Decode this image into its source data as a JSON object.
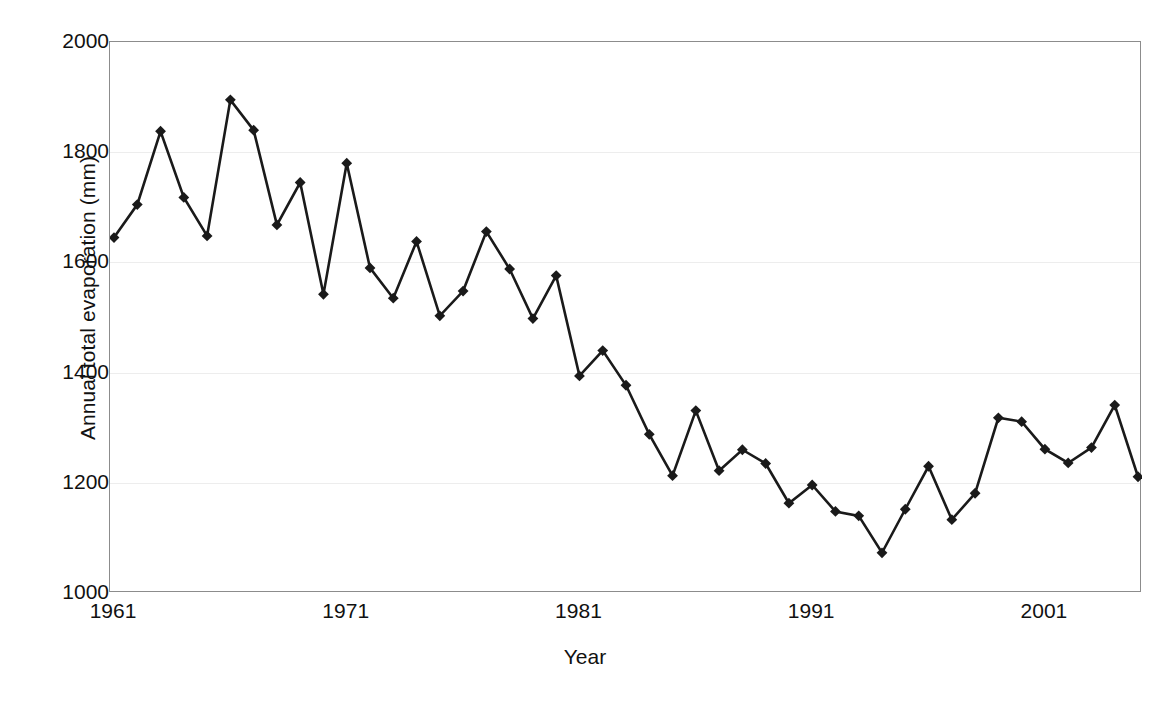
{
  "chart_data": {
    "type": "line",
    "title": "",
    "xlabel": "Year",
    "ylabel": "Annual total evaporation (mm)",
    "xlim": [
      1960,
      2006
    ],
    "ylim": [
      1000,
      2000
    ],
    "ytick_labels": [
      "2000",
      "1800",
      "1600",
      "1400",
      "1200",
      "1000"
    ],
    "ytick_values": [
      2000,
      1800,
      1600,
      1400,
      1200,
      1000
    ],
    "xtick_labels": [
      "1961",
      "1971",
      "1981",
      "1991",
      "2001"
    ],
    "xtick_values": [
      1961,
      1971,
      1981,
      1991,
      2001
    ],
    "grid": "horizontal",
    "legend": "none",
    "marker": "diamond",
    "line_color": "#1a1a1a",
    "marker_color": "#1a1a1a",
    "grid_color": "#ededed",
    "axis_color": "#8c8c8c",
    "x": [
      1961,
      1962,
      1963,
      1964,
      1965,
      1966,
      1967,
      1968,
      1969,
      1970,
      1971,
      1972,
      1973,
      1974,
      1975,
      1976,
      1977,
      1978,
      1979,
      1980,
      1981,
      1982,
      1983,
      1984,
      1985,
      1986,
      1987,
      1988,
      1989,
      1990,
      1991,
      1992,
      1993,
      1994,
      1995,
      1996,
      1997,
      1998,
      1999,
      2000,
      2001,
      2002,
      2003,
      2004,
      2005
    ],
    "values": [
      1645,
      1705,
      1838,
      1718,
      1648,
      1895,
      1840,
      1668,
      1745,
      1542,
      1780,
      1590,
      1535,
      1638,
      1503,
      1548,
      1656,
      1588,
      1498,
      1576,
      1394,
      1440,
      1377,
      1288,
      1213,
      1331,
      1222,
      1260,
      1235,
      1163,
      1196,
      1148,
      1140,
      1073,
      1152,
      1230,
      1133,
      1181,
      1318,
      1311,
      1261,
      1236,
      1264,
      1341,
      1211
    ]
  },
  "axes": {
    "y_title": "Annual total evaporation (mm)",
    "x_title": "Year"
  }
}
